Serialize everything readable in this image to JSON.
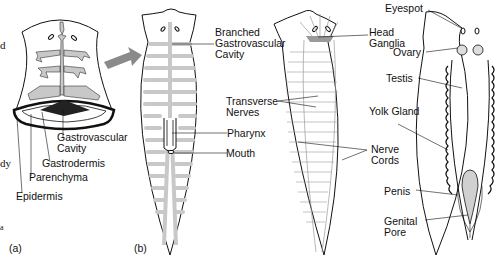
{
  "figure": {
    "panels": [
      "(a)",
      "(b)"
    ],
    "edge_fragments": [
      "d",
      "dy",
      "a"
    ]
  },
  "panel_a": {
    "labels": {
      "gastrovascular_cavity": "Gastrovascular\nCavity",
      "gastrodermis": "Gastrodermis",
      "parenchyma": "Parenchyma",
      "epidermis": "Epidermis"
    }
  },
  "panel_b": {
    "digestive": {
      "branched_gastrovascular_cavity": "Branched\nGastrovascular\nCavity",
      "pharynx": "Pharynx",
      "mouth": "Mouth"
    },
    "nervous": {
      "head_ganglia": "Head\nGanglia",
      "transverse_nerves": "Transverse\nNerves",
      "nerve_cords": "Nerve\nCords"
    },
    "reproductive": {
      "eyespot": "Eyespot",
      "ovary": "Ovary",
      "testis": "Testis",
      "yolk_gland": "Yolk Gland",
      "penis": "Penis",
      "genital_pore": "Genital\nPore"
    }
  },
  "colors": {
    "outline": "#111111",
    "gut_gray": "#c8c8c8",
    "dark_cavity": "#222222",
    "arrow_gray": "#8a8a8a",
    "nerve_gray": "#9a9a9a"
  }
}
